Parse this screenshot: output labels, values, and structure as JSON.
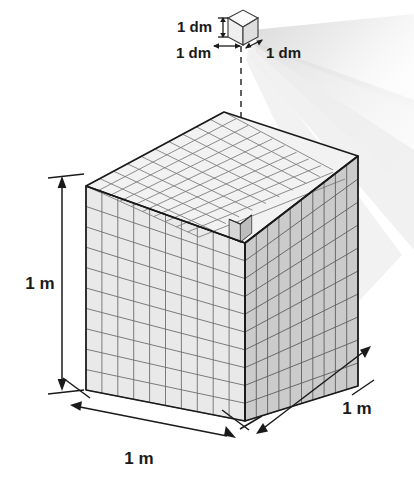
{
  "figure": {
    "labels": {
      "small_cube_height": "1 dm",
      "small_cube_width": "1 dm",
      "small_cube_depth": "1 dm",
      "big_cube_height": "1 m",
      "big_cube_width": "1 m",
      "big_cube_depth": "1 m"
    },
    "geometry": {
      "divisions_per_edge": 10,
      "unit_cube_label": "1 dm",
      "big_cube_label": "1 m",
      "removed_cubes": 1
    },
    "colors": {
      "background": "#ffffff",
      "top_face": "#f2f2f2",
      "left_face": "#e9e9e9",
      "right_face": "#c9c9c9",
      "grid_line": "#6e6e6e",
      "outline": "#1a1a1a",
      "beam": "#e4e4e4",
      "text": "#1a1a1a"
    }
  }
}
